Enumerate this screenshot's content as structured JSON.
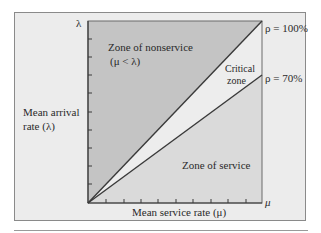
{
  "diagram": {
    "y_axis": {
      "symbol": "λ",
      "label_line1": "Mean arrival",
      "label_line2": "rate (λ)"
    },
    "x_axis": {
      "symbol": "μ",
      "label": "Mean service rate (μ)"
    },
    "zones": {
      "nonservice": {
        "line1": "Zone of nonservice",
        "line2": "(μ < λ)"
      },
      "critical": {
        "line1": "Critical",
        "line2": "zone"
      },
      "service": {
        "label": "Zone of service"
      }
    },
    "lines": {
      "rho_100": "ρ = 100%",
      "rho_70": "ρ = 70%"
    },
    "colors": {
      "frame_bg": "#ececec",
      "nonservice_fill": "#c4c4c4",
      "critical_fill": "#ededed",
      "service_fill": "#dadada",
      "line": "#3a3a3a"
    },
    "ticks": {
      "y_count": 9,
      "x_count": 9
    }
  }
}
